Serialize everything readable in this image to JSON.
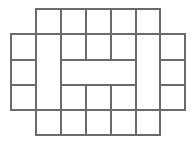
{
  "figure": {
    "title": "",
    "kind": "grid-polyomino-outline",
    "canvas": {
      "width": 195,
      "height": 146,
      "background": "#ffffff"
    },
    "style": {
      "line_color": "#6b6b6b",
      "line_width": 1.1,
      "fill": "none"
    },
    "lattice": {
      "cell_width": 24.8,
      "cell_height": 25.2,
      "x_coords": [
        11,
        36,
        61,
        86,
        111,
        136,
        160,
        185
      ],
      "y_coords": [
        9,
        34,
        60,
        85,
        110,
        135
      ],
      "columns": 7,
      "rows": 5
    },
    "segments": [
      {
        "name": "h-top-of-upper-arms",
        "x1": 36,
        "y1": 9,
        "x2": 160,
        "y2": 9
      },
      {
        "name": "h-upper-shoulder",
        "x1": 11,
        "y1": 34,
        "x2": 185,
        "y2": 34
      },
      {
        "name": "h-upper-notch-floor",
        "x1": 61,
        "y1": 60,
        "x2": 136,
        "y2": 60
      },
      {
        "name": "h-left-mid-tick",
        "x1": 11,
        "y1": 60,
        "x2": 36,
        "y2": 60
      },
      {
        "name": "h-right-mid-tick",
        "x1": 160,
        "y1": 60,
        "x2": 185,
        "y2": 60
      },
      {
        "name": "h-lower-notch-roof",
        "x1": 61,
        "y1": 85,
        "x2": 136,
        "y2": 85
      },
      {
        "name": "h-left-low-tick",
        "x1": 11,
        "y1": 85,
        "x2": 36,
        "y2": 85
      },
      {
        "name": "h-right-low-tick",
        "x1": 160,
        "y1": 85,
        "x2": 185,
        "y2": 85
      },
      {
        "name": "h-lower-shoulder",
        "x1": 11,
        "y1": 110,
        "x2": 185,
        "y2": 110
      },
      {
        "name": "h-bottom-of-arms",
        "x1": 36,
        "y1": 135,
        "x2": 160,
        "y2": 135
      },
      {
        "name": "v-left-outer",
        "x1": 11,
        "y1": 34,
        "x2": 11,
        "y2": 110
      },
      {
        "name": "v-col2",
        "x1": 36,
        "y1": 9,
        "x2": 36,
        "y2": 135
      },
      {
        "name": "v-col3-upper",
        "x1": 61,
        "y1": 9,
        "x2": 61,
        "y2": 60
      },
      {
        "name": "v-col3-lower",
        "x1": 61,
        "y1": 85,
        "x2": 61,
        "y2": 135
      },
      {
        "name": "v-col4-upper",
        "x1": 86,
        "y1": 9,
        "x2": 86,
        "y2": 60
      },
      {
        "name": "v-col4-lower",
        "x1": 86,
        "y1": 85,
        "x2": 86,
        "y2": 135
      },
      {
        "name": "v-col5-upper",
        "x1": 111,
        "y1": 9,
        "x2": 111,
        "y2": 60
      },
      {
        "name": "v-col5-lower",
        "x1": 111,
        "y1": 85,
        "x2": 111,
        "y2": 135
      },
      {
        "name": "v-col6-upper",
        "x1": 136,
        "y1": 9,
        "x2": 136,
        "y2": 60
      },
      {
        "name": "v-col6-lower",
        "x1": 136,
        "y1": 85,
        "x2": 136,
        "y2": 135
      },
      {
        "name": "v-col7",
        "x1": 160,
        "y1": 9,
        "x2": 160,
        "y2": 135
      },
      {
        "name": "v-right-outer",
        "x1": 185,
        "y1": 34,
        "x2": 185,
        "y2": 110
      },
      {
        "name": "v-mid-bar-left",
        "x1": 61,
        "y1": 60,
        "x2": 61,
        "y2": 85
      },
      {
        "name": "v-mid-bar-right",
        "x1": 136,
        "y1": 60,
        "x2": 136,
        "y2": 85
      }
    ]
  }
}
